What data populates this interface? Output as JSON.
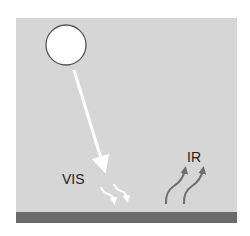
{
  "diagram": {
    "type": "radiation-balance",
    "labels": {
      "vis": "VIS",
      "ir": "IR"
    },
    "elements": {
      "sun": "sun-circle",
      "incoming": "visible-light-arrow",
      "absorbed": "visible-absorbed-squiggle-arrows",
      "emitted": "infrared-emission-arrows",
      "surface": "ground-surface"
    },
    "colors": {
      "background_panel": "#d6d6d6",
      "ground": "#6a6a6a",
      "sun_fill": "#ffffff",
      "sun_stroke": "#555555",
      "visible_arrow": "#ffffff",
      "ir_arrow": "#6e6e6e",
      "text": "#222222"
    }
  }
}
